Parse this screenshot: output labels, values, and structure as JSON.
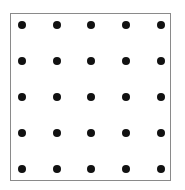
{
  "diagram": {
    "type": "dot-grid",
    "rows": 5,
    "cols": 5,
    "dot_color": "#111111",
    "border_color": "#8a8a8a",
    "background": "#ffffff",
    "dot_radius": 4,
    "col_x": [
      22,
      57,
      91,
      126,
      161
    ],
    "row_y": [
      25,
      61,
      97,
      133,
      169
    ]
  }
}
